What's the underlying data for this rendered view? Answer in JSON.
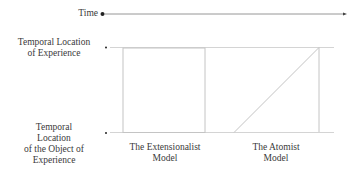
{
  "time_axis": {
    "label": "Time"
  },
  "y_labels": {
    "top": [
      "Temporal Location",
      "of Experience"
    ],
    "bottom": [
      "Temporal",
      "Location",
      "of the Object of",
      "Experience"
    ]
  },
  "models": [
    {
      "label_line1": "The Extensionalist",
      "label_line2": "Model"
    },
    {
      "label_line1": "The Atomist",
      "label_line2": "Model"
    }
  ],
  "colors": {
    "text": "#3a3a3a",
    "dot": "#222222",
    "time_line": "#8a8a8a",
    "lines": "#c8c8c8"
  }
}
